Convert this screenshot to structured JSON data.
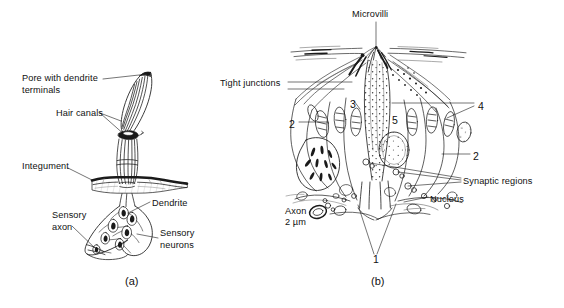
{
  "figure": {
    "background_color": "#ffffff",
    "ink_color": "#1a1a1a",
    "width": 564,
    "height": 308,
    "caption_a": "(a)",
    "caption_b": "(b)"
  },
  "panel_a": {
    "name": "Sensillum external and neuronal anatomy",
    "labels": [
      {
        "id": "pore-with-dendrite-terminals",
        "text": "Pore with dendrite\nterminals",
        "x": 22,
        "y": 73
      },
      {
        "id": "hair-canals",
        "text": "Hair canals",
        "x": 56,
        "y": 108
      },
      {
        "id": "integument",
        "text": "Integument",
        "x": 22,
        "y": 161
      },
      {
        "id": "dendrite",
        "text": "Dendrite",
        "x": 152,
        "y": 198
      },
      {
        "id": "sensory-axon",
        "text": "Sensory\naxon",
        "x": 52,
        "y": 210
      },
      {
        "id": "sensory-neurons",
        "text": "Sensory\nneurons",
        "x": 160,
        "y": 228
      }
    ]
  },
  "panel_b": {
    "name": "Ultrastructure of sensory cells with numbered regions",
    "labels": [
      {
        "id": "microvilli",
        "text": "Microvilli",
        "x": 352,
        "y": 9
      },
      {
        "id": "tight-junctions",
        "text": "Tight junctions",
        "x": 220,
        "y": 78
      },
      {
        "id": "synaptic-regions",
        "text": "Synaptic regions",
        "x": 463,
        "y": 176
      },
      {
        "id": "nucleus",
        "text": "Nucleus",
        "x": 430,
        "y": 194
      },
      {
        "id": "axon",
        "text": "Axon",
        "x": 285,
        "y": 206
      },
      {
        "id": "axon-scale",
        "text": "2 µm",
        "x": 285,
        "y": 217
      }
    ],
    "numbers": [
      {
        "id": "region-2-left",
        "text": "2",
        "x": 289,
        "y": 118
      },
      {
        "id": "region-3",
        "text": "3",
        "x": 350,
        "y": 98
      },
      {
        "id": "region-5",
        "text": "5",
        "x": 392,
        "y": 114
      },
      {
        "id": "region-4",
        "text": "4",
        "x": 478,
        "y": 100
      },
      {
        "id": "region-2-right",
        "text": "2",
        "x": 473,
        "y": 150
      },
      {
        "id": "region-1",
        "text": "1",
        "x": 373,
        "y": 258
      }
    ]
  }
}
